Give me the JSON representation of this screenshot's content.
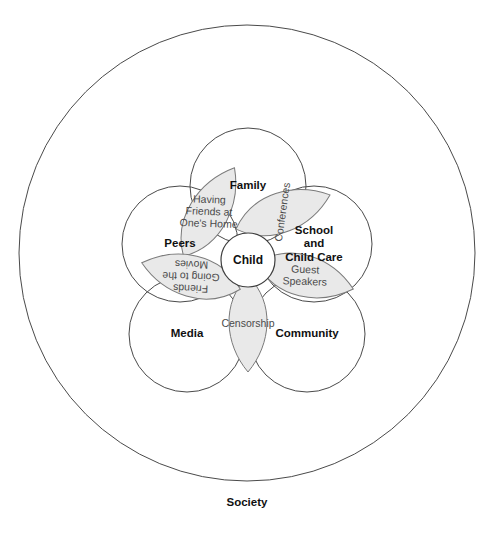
{
  "figure": {
    "title_text": "Society",
    "center_label": "Child",
    "outer_ring_name": "Society"
  },
  "domains": [
    {
      "id": "family",
      "label": "Family",
      "label_lines": [
        "Family"
      ],
      "cx": 248,
      "cy": 186,
      "r": 58
    },
    {
      "id": "school",
      "label": "School and Child Care",
      "label_lines": [
        "School",
        "and",
        "Child Care"
      ],
      "cx": 314,
      "cy": 244,
      "r": 58
    },
    {
      "id": "community",
      "label": "Community",
      "label_lines": [
        "Community"
      ],
      "cx": 307,
      "cy": 334,
      "r": 58
    },
    {
      "id": "media",
      "label": "Media",
      "label_lines": [
        "Media"
      ],
      "cx": 187,
      "cy": 334,
      "r": 58
    },
    {
      "id": "peers",
      "label": "Peers",
      "label_lines": [
        "Peers"
      ],
      "cx": 180,
      "cy": 244,
      "r": 58
    }
  ],
  "connections": [
    {
      "id": "having-friends-at-ones-home",
      "label": "Having Friends at One's Home",
      "lines": [
        "Having",
        "Friends at",
        "One's Home"
      ],
      "angle": -60,
      "text_rotation": 62,
      "cx": 209,
      "cy": 212,
      "rx": 51,
      "ry": 24
    },
    {
      "id": "conferences",
      "label": "Conferences",
      "lines": [
        "Conferences"
      ],
      "angle": -20,
      "text_rotation": -62,
      "cx": 283,
      "cy": 212,
      "rx": 50,
      "ry": 24
    },
    {
      "id": "guest-speakers",
      "label": "Guest Speakers",
      "lines": [
        "Guest",
        "Speakers"
      ],
      "angle": 15,
      "text_rotation": -13,
      "cx": 305,
      "cy": 276,
      "rx": 50,
      "ry": 25
    },
    {
      "id": "censorship",
      "label": "Censorship",
      "lines": [
        "Censorship"
      ],
      "angle": 90,
      "text_rotation": -90,
      "cx": 248,
      "cy": 324,
      "rx": 48,
      "ry": 23
    },
    {
      "id": "friends-going-to-the-movies",
      "label": "Friends Going to the Movies",
      "lines": [
        "Friends",
        "Going to the",
        "Movies"
      ],
      "angle": 195,
      "text_rotation": -13,
      "cx": 191,
      "cy": 276,
      "rx": 51,
      "ry": 25
    }
  ],
  "geometry": {
    "outer_circle": {
      "cx": 247,
      "cy": 253,
      "r": 228
    },
    "core_circle": {
      "cx": 248,
      "cy": 260,
      "r": 27
    },
    "society_label_pos": {
      "x": 247,
      "y": 503
    }
  },
  "colors": {
    "petal_fill": "#e9e9e9",
    "petal_stroke": "#7a7a7a",
    "circle_stroke": "#4a4a4a",
    "text_dark": "#111111",
    "text_gray": "#4b4b4b",
    "background": "#ffffff"
  }
}
